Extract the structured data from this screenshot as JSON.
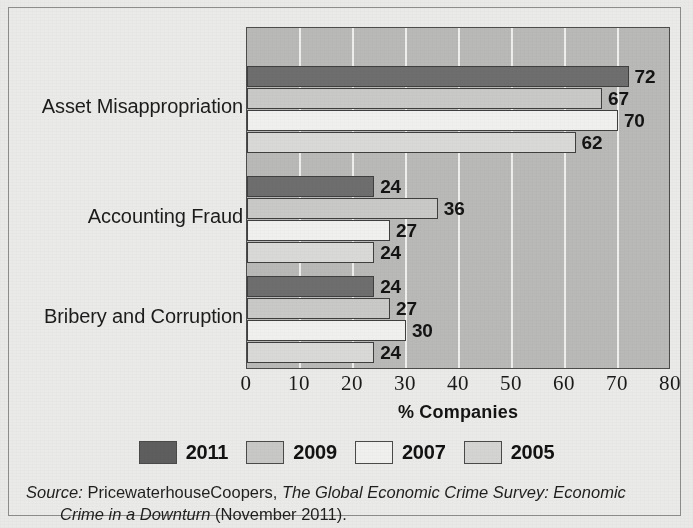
{
  "figure": {
    "x_axis_title": "% Companies",
    "source_prefix": "Source:",
    "source_org": "PricewaterhouseCoopers,",
    "source_title_line1": "The Global Economic Crime Survey: Economic",
    "source_title_line2": "Crime in a Downturn",
    "source_suffix": "(November 2011)."
  },
  "chart_data": {
    "type": "bar",
    "orientation": "horizontal",
    "title": "",
    "xlabel": "% Companies",
    "ylabel": "",
    "xlim": [
      0,
      80
    ],
    "xticks": [
      0,
      10,
      20,
      30,
      40,
      50,
      60,
      70,
      80
    ],
    "grid": "vertical",
    "legend_position": "bottom",
    "categories": [
      "Asset Misappropriation",
      "Accounting Fraud",
      "Bribery and Corruption"
    ],
    "series": [
      {
        "name": "2011",
        "color": "#6e6e6e",
        "values": [
          72,
          24,
          24
        ]
      },
      {
        "name": "2009",
        "color": "#c9c9c7",
        "values": [
          67,
          36,
          27
        ]
      },
      {
        "name": "2007",
        "color": "#f0f0ee",
        "values": [
          70,
          27,
          30
        ]
      },
      {
        "name": "2005",
        "color": "#d9d9d7",
        "values": [
          62,
          24,
          24
        ]
      }
    ],
    "data_labels": [
      {
        "category": "Asset Misappropriation",
        "series": "2011",
        "value": 72
      },
      {
        "category": "Asset Misappropriation",
        "series": "2009",
        "value": 67
      },
      {
        "category": "Asset Misappropriation",
        "series": "2007",
        "value": 70
      },
      {
        "category": "Asset Misappropriation",
        "series": "2005",
        "value": 62
      },
      {
        "category": "Accounting Fraud",
        "series": "2011",
        "value": 24
      },
      {
        "category": "Accounting Fraud",
        "series": "2009",
        "value": 36
      },
      {
        "category": "Accounting Fraud",
        "series": "2007",
        "value": 27
      },
      {
        "category": "Accounting Fraud",
        "series": "2005",
        "value": 24
      },
      {
        "category": "Bribery and Corruption",
        "series": "2011",
        "value": 24
      },
      {
        "category": "Bribery and Corruption",
        "series": "2009",
        "value": 27
      },
      {
        "category": "Bribery and Corruption",
        "series": "2007",
        "value": 30
      },
      {
        "category": "Bribery and Corruption",
        "series": "2005",
        "value": 24
      }
    ]
  },
  "legend": {
    "items": [
      {
        "label": "2011",
        "key": "y2011"
      },
      {
        "label": "2009",
        "key": "y2009"
      },
      {
        "label": "2007",
        "key": "y2007"
      },
      {
        "label": "2005",
        "key": "y2005"
      }
    ]
  }
}
